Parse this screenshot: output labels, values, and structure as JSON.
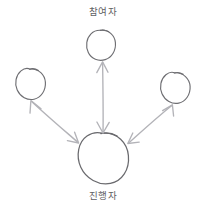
{
  "diagram": {
    "style": "hand-drawn sketch",
    "background_color": "#ffffff",
    "node_stroke_color": "#6e6e72",
    "arrow_stroke_color": "#b3b3b8",
    "label_text_color": "#5f5f64",
    "labels": {
      "top": "참여자",
      "bottom": "진행자"
    },
    "nodes": [
      {
        "id": "participant-top",
        "role": "participant",
        "label_ref": "top",
        "shape": "circle",
        "cx": 101,
        "cy": 45,
        "rx": 14,
        "ry": 15
      },
      {
        "id": "participant-left",
        "role": "participant",
        "label_ref": "",
        "shape": "circle",
        "cx": 30,
        "cy": 84,
        "rx": 15,
        "ry": 15
      },
      {
        "id": "participant-right",
        "role": "participant",
        "label_ref": "",
        "shape": "circle",
        "cx": 175,
        "cy": 88,
        "rx": 15,
        "ry": 15
      },
      {
        "id": "facilitator-main",
        "role": "facilitator",
        "label_ref": "bottom",
        "shape": "circle",
        "cx": 103,
        "cy": 158,
        "rx": 25,
        "ry": 25
      }
    ],
    "connections": [
      {
        "id": "arrow-center-vertical",
        "from": "facilitator-main",
        "to": "participant-top",
        "direction": "bidirectional",
        "style": "straight"
      },
      {
        "id": "arrow-left-diagonal",
        "from": "facilitator-main",
        "to": "participant-left",
        "direction": "bidirectional",
        "style": "curved"
      },
      {
        "id": "arrow-right-diagonal",
        "from": "facilitator-main",
        "to": "participant-right",
        "direction": "bidirectional",
        "style": "curved"
      }
    ]
  }
}
